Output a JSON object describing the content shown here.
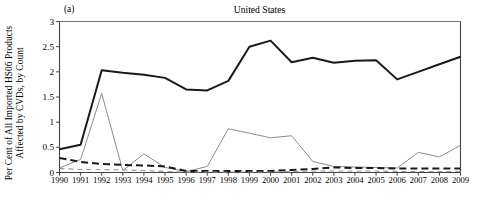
{
  "figure": {
    "panel_label": "(a)",
    "title": "United States",
    "ylabel_line1": "Per Cent of All Imported HS06 Products",
    "ylabel_line2": "Affected by CVDs, by Count",
    "colors": {
      "solid_black": "#1a1a1a",
      "solid_gray": "#8c8c8c",
      "dashed_black": "#1a1a1a",
      "dashed_gray": "#9a9a9a",
      "axis": "#444444",
      "background": "#ffffff"
    }
  },
  "chart_data": {
    "type": "line",
    "title": "United States",
    "xlabel": "",
    "ylabel": "Per Cent of All Imported HS06 Products Affected by CVDs, by Count",
    "xlim": [
      1990,
      2009
    ],
    "ylim": [
      0,
      3
    ],
    "yticks": [
      0,
      0.5,
      1,
      1.5,
      2,
      2.5,
      3
    ],
    "ytick_labels": [
      "0",
      "0.5",
      "1",
      "1.5",
      "2",
      "2.5",
      "3"
    ],
    "grid": false,
    "legend": "none",
    "categories": [
      1990,
      1991,
      1992,
      1993,
      1994,
      1995,
      1996,
      1997,
      1998,
      1999,
      2000,
      2001,
      2002,
      2003,
      2004,
      2005,
      2006,
      2007,
      2008,
      2009
    ],
    "xtick_labels": [
      "1990",
      "1991",
      "1992",
      "1993",
      "1994",
      "1995",
      "1996",
      "1997",
      "1998",
      "1999",
      "2000",
      "2001",
      "2002",
      "2003",
      "2004",
      "2005",
      "2006",
      "2007",
      "2008",
      "2009"
    ],
    "series": [
      {
        "name": "stock-solid-black",
        "style": "solid",
        "color": "#1a1a1a",
        "width": 2.0,
        "values": [
          0.46,
          0.55,
          2.03,
          1.98,
          1.94,
          1.88,
          1.65,
          1.63,
          1.82,
          2.5,
          2.62,
          2.19,
          2.28,
          2.18,
          2.22,
          2.23,
          1.85,
          2.0,
          2.15,
          2.3
        ]
      },
      {
        "name": "flow-solid-gray",
        "style": "solid",
        "color": "#8c8c8c",
        "width": 1.0,
        "values": [
          0.09,
          0.26,
          1.57,
          0.04,
          0.37,
          0.1,
          0.02,
          0.12,
          0.87,
          0.78,
          0.69,
          0.73,
          0.22,
          0.12,
          0.11,
          0.1,
          0.09,
          0.4,
          0.31,
          0.54
        ]
      },
      {
        "name": "stock-dashed-black",
        "style": "dashed",
        "color": "#1a1a1a",
        "width": 2.0,
        "values": [
          0.29,
          0.21,
          0.17,
          0.15,
          0.14,
          0.12,
          0.03,
          0.03,
          0.03,
          0.03,
          0.03,
          0.05,
          0.07,
          0.1,
          0.09,
          0.09,
          0.08,
          0.08,
          0.08,
          0.08
        ]
      },
      {
        "name": "flow-dashed-gray",
        "style": "dashed",
        "color": "#9a9a9a",
        "width": 1.2,
        "values": [
          0.08,
          0.06,
          0.06,
          0.05,
          0.04,
          0.02,
          0.01,
          0.01,
          0.01,
          0.01,
          0.01,
          0.02,
          0.03,
          0.03,
          0.03,
          0.03,
          0.02,
          0.02,
          0.02,
          0.02
        ]
      }
    ]
  }
}
